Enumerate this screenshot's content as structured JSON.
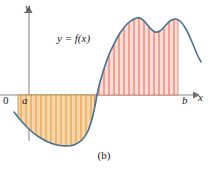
{
  "figure": {
    "caption": "(b)",
    "background_color": "#ffffff"
  },
  "axes": {
    "x_label": "x",
    "y_label": "y",
    "origin_label": "0",
    "left_bound_label": "a",
    "right_bound_label": "b",
    "axis_color": "#8a8a8a",
    "x_axis_y_px": 95,
    "y_axis_x_px": 12
  },
  "curve": {
    "label": "y = f(x)",
    "color": "#4a7396",
    "stroke_width": 1.6
  },
  "regions": {
    "negative": {
      "name": "negative-area",
      "fill_color": "#f6d6a8",
      "hatch_color": "#e2922f",
      "outline_color": "#4a7396",
      "sign": "-"
    },
    "positive": {
      "name": "positive-area",
      "fill_color": "#fbdcd4",
      "hatch_color": "#dc5c49",
      "outline_color": "#4a7396",
      "sign": "+"
    }
  },
  "chart_data": {
    "type": "area",
    "title": "",
    "subtitle": "",
    "xlabel": "x",
    "ylabel": "y",
    "annotations": [
      "y = f(x)",
      "a",
      "b",
      "0",
      "(b)"
    ],
    "grid": false,
    "legend": "none",
    "xlim": [
      0,
      208
    ],
    "ylim": [
      0,
      169
    ],
    "axis_baseline_y": 95,
    "a_x": 18,
    "b_x": 178,
    "zero_crossing_x": 95,
    "curve_points": [
      [
        14,
        112
      ],
      [
        18,
        117
      ],
      [
        24,
        124
      ],
      [
        31,
        131
      ],
      [
        39,
        137
      ],
      [
        48,
        142
      ],
      [
        57,
        145
      ],
      [
        66,
        146
      ],
      [
        74,
        145
      ],
      [
        82,
        140
      ],
      [
        88,
        131
      ],
      [
        92,
        119
      ],
      [
        95,
        106
      ],
      [
        97,
        95
      ],
      [
        99,
        86
      ],
      [
        103,
        72
      ],
      [
        108,
        57
      ],
      [
        114,
        44
      ],
      [
        120,
        33
      ],
      [
        127,
        24
      ],
      [
        134,
        19
      ],
      [
        140,
        18
      ],
      [
        145,
        22
      ],
      [
        150,
        28
      ],
      [
        155,
        32
      ],
      [
        160,
        31
      ],
      [
        165,
        26
      ],
      [
        170,
        21
      ],
      [
        175,
        19
      ],
      [
        180,
        21
      ],
      [
        186,
        29
      ],
      [
        192,
        42
      ],
      [
        197,
        54
      ],
      [
        201,
        62
      ]
    ],
    "negative_hatch_x": [
      21,
      26,
      31,
      36,
      41,
      46,
      51,
      56,
      61,
      66,
      71,
      76,
      81,
      86,
      91
    ],
    "positive_hatch_x": [
      99,
      104,
      109,
      114,
      119,
      124,
      129,
      134,
      139,
      144,
      149,
      154,
      159,
      164,
      169,
      174
    ],
    "step_edges_x": [
      86,
      91,
      96,
      101,
      106,
      111,
      116,
      121
    ]
  }
}
